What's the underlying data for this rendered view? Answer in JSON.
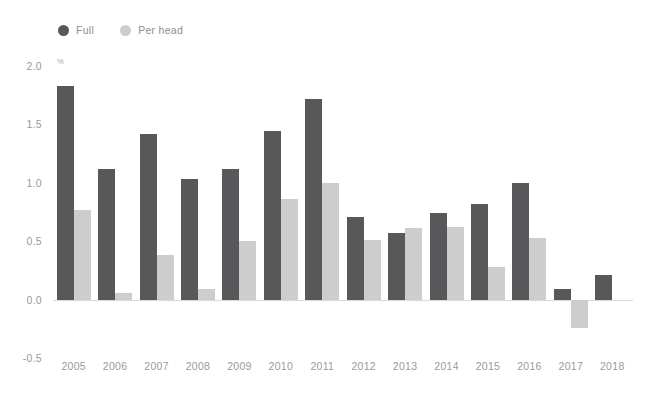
{
  "title_sliver": "",
  "legend": {
    "position": "top-left",
    "items": [
      {
        "label": "Full",
        "color": "#58585a",
        "marker": "circle"
      },
      {
        "label": "Per head",
        "color": "#cdcdcd",
        "marker": "circle"
      }
    ]
  },
  "colors": {
    "full": "#58585a",
    "per_head": "#cdcdcd",
    "axis_line": "#d8d8d8",
    "tick_text": "#9a9a9a",
    "legend_text": "#8e8e8e",
    "background": "#ffffff"
  },
  "chart_data": {
    "type": "bar",
    "title": "",
    "subtitle": "",
    "xlabel": "",
    "ylabel": "",
    "unit": "%",
    "grid": false,
    "legend_position": "top-left",
    "ylim": [
      -0.5,
      2.0
    ],
    "yticks": [
      2.0,
      1.5,
      1.0,
      0.5,
      0.0,
      -0.5
    ],
    "ytick_labels": [
      "2.0",
      "1.5",
      "1.0",
      "0.5",
      "0.0",
      "-0.5"
    ],
    "categories": [
      "2005",
      "2006",
      "2007",
      "2008",
      "2009",
      "2010",
      "2011",
      "2012",
      "2013",
      "2014",
      "2015",
      "2016",
      "2017",
      "2018"
    ],
    "series": [
      {
        "name": "Full",
        "color": "#58585a",
        "values": [
          1.83,
          1.12,
          1.42,
          1.03,
          1.12,
          1.44,
          1.72,
          0.71,
          0.57,
          0.74,
          0.82,
          1.0,
          0.09,
          0.21
        ]
      },
      {
        "name": "Per head",
        "color": "#cdcdcd",
        "values": [
          0.77,
          0.06,
          0.38,
          0.09,
          0.5,
          0.86,
          1.0,
          0.51,
          0.61,
          0.62,
          0.28,
          0.53,
          -0.24,
          null
        ]
      }
    ]
  }
}
